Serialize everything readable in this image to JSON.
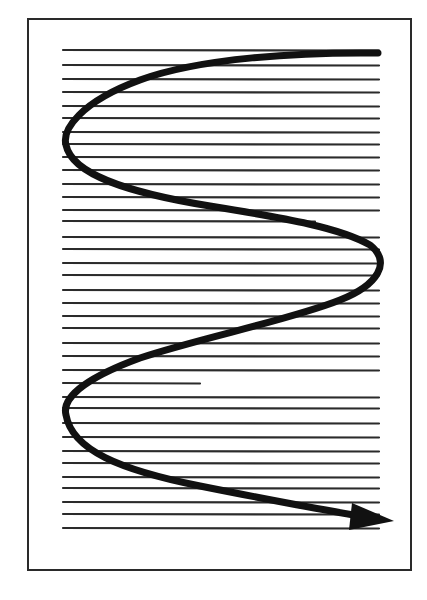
{
  "diagram": {
    "title": "",
    "colors": {
      "background": "#ffffff",
      "ink": "#1a1a1a",
      "page_border": "#2a2a2a",
      "text_line": "#2b2b2b",
      "path": "#111111"
    },
    "page": {
      "x": 28,
      "y": 19,
      "width": 383,
      "height": 551
    },
    "text_lines": {
      "x_start": 63,
      "x_end": 379,
      "stroke_width": 2.2,
      "lines": [
        {
          "y": 50,
          "x_end": 379
        },
        {
          "y": 65,
          "x_end": 379
        },
        {
          "y": 79,
          "x_end": 379
        },
        {
          "y": 92,
          "x_end": 379
        },
        {
          "y": 106,
          "x_end": 379
        },
        {
          "y": 118,
          "x_end": 379
        },
        {
          "y": 132,
          "x_end": 379
        },
        {
          "y": 144,
          "x_end": 379
        },
        {
          "y": 157,
          "x_end": 379
        },
        {
          "y": 170,
          "x_end": 379
        },
        {
          "y": 184,
          "x_end": 379
        },
        {
          "y": 197,
          "x_end": 379
        },
        {
          "y": 210,
          "x_end": 379
        },
        {
          "y": 221,
          "x_end": 315
        },
        {
          "y": 237,
          "x_end": 379
        },
        {
          "y": 249,
          "x_end": 379
        },
        {
          "y": 263,
          "x_end": 379
        },
        {
          "y": 275,
          "x_end": 379
        },
        {
          "y": 290,
          "x_end": 379
        },
        {
          "y": 303,
          "x_end": 379
        },
        {
          "y": 316,
          "x_end": 379
        },
        {
          "y": 328,
          "x_end": 379
        },
        {
          "y": 343,
          "x_end": 379
        },
        {
          "y": 356,
          "x_end": 379
        },
        {
          "y": 370,
          "x_end": 379
        },
        {
          "y": 383,
          "x_end": 200
        },
        {
          "y": 397,
          "x_end": 379
        },
        {
          "y": 408,
          "x_end": 379
        },
        {
          "y": 423,
          "x_end": 379
        },
        {
          "y": 437,
          "x_end": 379
        },
        {
          "y": 451,
          "x_end": 379
        },
        {
          "y": 463,
          "x_end": 379
        },
        {
          "y": 477,
          "x_end": 379
        },
        {
          "y": 488,
          "x_end": 379
        },
        {
          "y": 502,
          "x_end": 379
        },
        {
          "y": 514,
          "x_end": 379
        },
        {
          "y": 528,
          "x_end": 379
        }
      ]
    },
    "reading_path": {
      "shape": "S-curve",
      "direction": "top-right to bottom-right",
      "stroke_width": 7,
      "d": "M 378 53 C 300 52, 200 58, 140 80 C 80 102, 62 130, 66 145 C 72 175, 130 193, 210 206 C 290 219, 340 228, 370 245 C 392 262, 378 285, 340 300 C 290 320, 200 338, 140 358 C 80 380, 62 400, 66 415 C 72 450, 120 470, 200 486 C 260 498, 310 508, 360 516",
      "arrowhead": {
        "tip": [
          394,
          521
        ],
        "points": "394,521 352,503 349,530",
        "icon": "arrowhead-icon"
      }
    }
  }
}
